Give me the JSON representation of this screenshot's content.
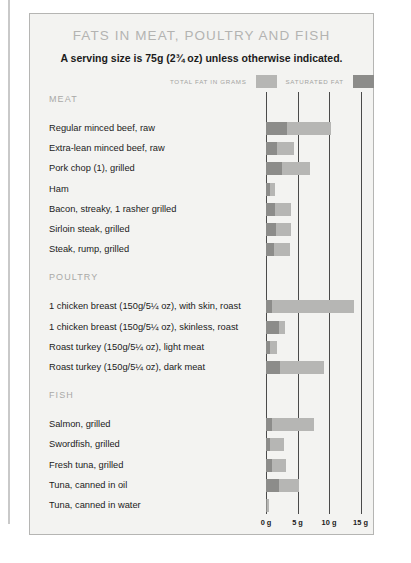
{
  "title": "FATS IN MEAT, POULTRY AND FISH",
  "subtitle": "A serving size is 75g (2¾ oz) unless otherwise indicated.",
  "legend": {
    "total_label": "TOTAL FAT IN GRAMS",
    "saturated_label": "SATURATED FAT",
    "total_color": "#b6b6b4",
    "saturated_color": "#8c8c8a"
  },
  "sections": [
    {
      "name": "MEAT"
    },
    {
      "name": "POULTRY"
    },
    {
      "name": "FISH"
    }
  ],
  "axis": {
    "ticks": [
      "0 g",
      "5 g",
      "10 g",
      "15 g"
    ],
    "values": [
      0,
      5,
      10,
      15
    ]
  },
  "chart_data": {
    "type": "bar",
    "title": "FATS IN MEAT, POULTRY AND FISH",
    "subtitle": "A serving size is 75g (2¾ oz) unless otherwise indicated.",
    "orientation": "horizontal",
    "xlabel": "Total fat in grams",
    "ylabel": "",
    "xlim": [
      0,
      17
    ],
    "xticks": [
      0,
      5,
      10,
      15
    ],
    "xticklabels": [
      "0 g",
      "5 g",
      "10 g",
      "15 g"
    ],
    "grid": "vertical",
    "legend_position": "top-right",
    "stacked": true,
    "series": [
      {
        "name": "SATURATED FAT",
        "color": "#8c8c8a"
      },
      {
        "name": "TOTAL FAT IN GRAMS",
        "color": "#b6b6b4"
      }
    ],
    "groups": [
      {
        "name": "MEAT",
        "items": [
          {
            "label": "Regular minced beef, raw",
            "saturated": 3.3,
            "total": 10.3
          },
          {
            "label": "Extra-lean minced beef, raw",
            "saturated": 1.8,
            "total": 4.4
          },
          {
            "label": "Pork chop (1), grilled",
            "saturated": 2.5,
            "total": 7.0
          },
          {
            "label": "Ham",
            "saturated": 0.6,
            "total": 1.5
          },
          {
            "label": "Bacon, streaky, 1 rasher grilled",
            "saturated": 1.5,
            "total": 3.9
          },
          {
            "label": "Sirloin steak, grilled",
            "saturated": 1.6,
            "total": 3.9
          },
          {
            "label": "Steak, rump, grilled",
            "saturated": 1.2,
            "total": 3.8
          }
        ]
      },
      {
        "name": "POULTRY",
        "items": [
          {
            "label": "1 chicken breast (150g/5¼ oz), with skin, roast",
            "saturated": 1.0,
            "total": 14.0
          },
          {
            "label": "1 chicken breast (150g/5¼ oz), skinless, roast",
            "saturated": 2.0,
            "total": 3.0
          },
          {
            "label": "Roast turkey (150g/5¼ oz), light meat",
            "saturated": 0.6,
            "total": 1.7
          },
          {
            "label": "Roast turkey (150g/5¼ oz), dark meat",
            "saturated": 2.3,
            "total": 9.2
          }
        ]
      },
      {
        "name": "FISH",
        "items": [
          {
            "label": "Salmon, grilled",
            "saturated": 0.9,
            "total": 7.6
          },
          {
            "label": "Swordfish, grilled",
            "saturated": 0.7,
            "total": 2.9
          },
          {
            "label": "Fresh tuna, grilled",
            "saturated": 0.9,
            "total": 3.2
          },
          {
            "label": "Tuna, canned in oil",
            "saturated": 2.1,
            "total": 5.3
          },
          {
            "label": "Tuna, canned in water",
            "saturated": 0.2,
            "total": 0.5
          }
        ]
      }
    ]
  }
}
